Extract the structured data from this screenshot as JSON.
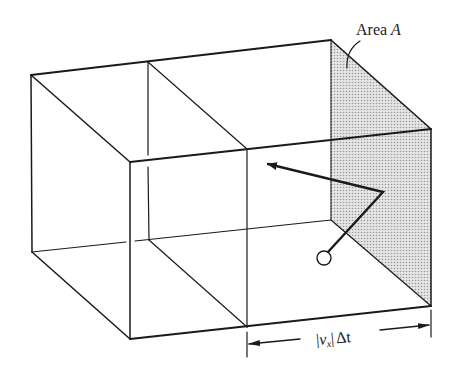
{
  "figure": {
    "type": "3d-box-diagram",
    "labels": {
      "area": "Area",
      "area_symbol": "A",
      "dimension_open": "|",
      "dimension_v": "v",
      "dimension_sub": "x",
      "dimension_close": "|",
      "dimension_dt": "Δt"
    },
    "colors": {
      "stroke": "#1a1a1a",
      "shaded_face": "#d4d4d4",
      "background": "#ffffff"
    }
  }
}
